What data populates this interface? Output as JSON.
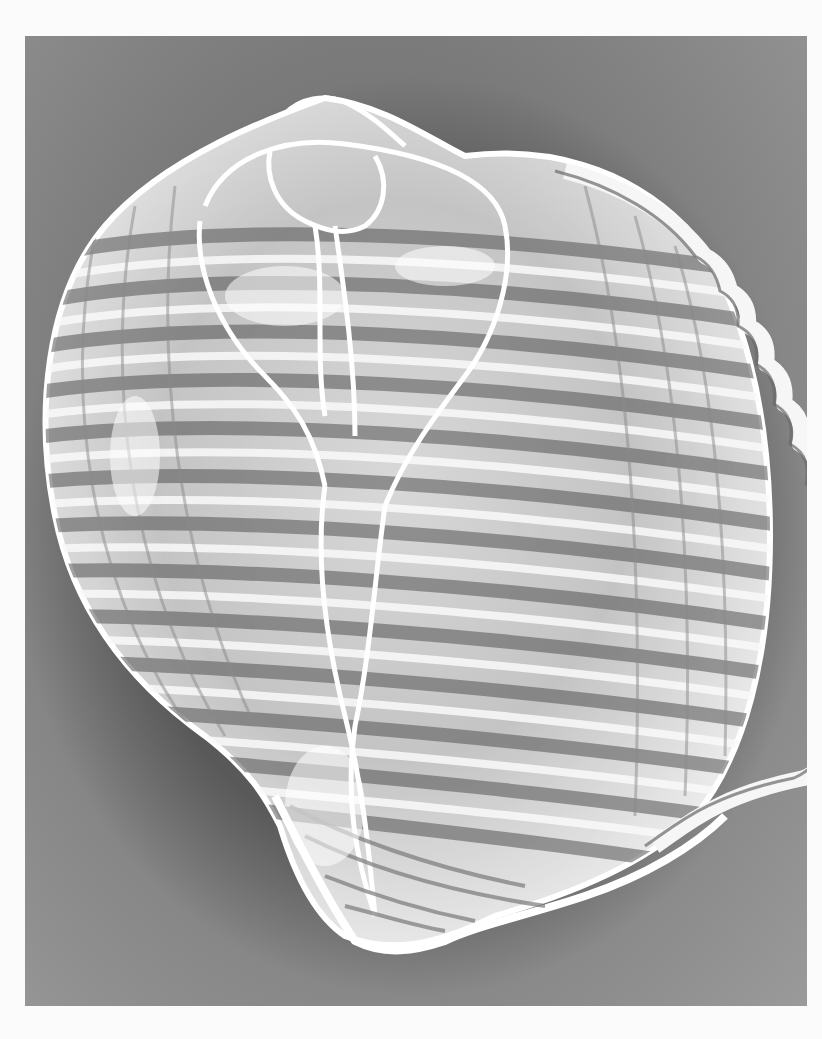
{
  "image": {
    "subject": "Tun shell (X-ray style photograph)",
    "alt_text": "Grayscale radiograph-like photograph of a large ribbed tun sea shell with scalloped outer lip against a gray background",
    "colors": {
      "page_background": "#fbfbfb",
      "panel_background": "#7a7a7a",
      "shell_highlight": "#ffffff",
      "shell_shadow": "#4a4a4a",
      "rib_shadow": "#5a5a5a"
    }
  }
}
